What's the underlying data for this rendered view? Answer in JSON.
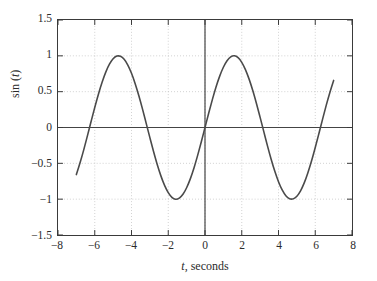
{
  "chart_data": {
    "type": "line",
    "title": "",
    "xlabel": "t, seconds",
    "xlabel_parts": {
      "symbol": "t",
      "rest": ", seconds"
    },
    "ylabel": "sin (t)",
    "ylabel_parts": {
      "prefix": "sin (",
      "symbol": "t",
      "suffix": ")"
    },
    "xlim": [
      -8,
      8
    ],
    "ylim": [
      -1.5,
      1.5
    ],
    "xticks": [
      -8,
      -6,
      -4,
      -2,
      0,
      2,
      4,
      6,
      8
    ],
    "xtick_labels": [
      "−8",
      "−6",
      "−4",
      "−2",
      "0",
      "2",
      "4",
      "6",
      "8"
    ],
    "yticks": [
      -1.5,
      -1,
      -0.5,
      0,
      0.5,
      1,
      1.5
    ],
    "ytick_labels": [
      "−1.5",
      "−1",
      "−0.5",
      "0",
      "0.5",
      "1",
      "1.5"
    ],
    "grid": true,
    "grid_style": "dotted",
    "legend": "none",
    "series": [
      {
        "name": "sin (t)",
        "color": "#4a4a4a",
        "line_width": 1.6,
        "x_start": -7,
        "x_end": 7,
        "x": [
          -7.0,
          -6.8,
          -6.6,
          -6.4,
          -6.2,
          -6.0,
          -5.8,
          -5.6,
          -5.4,
          -5.2,
          -5.0,
          -4.8,
          -4.6,
          -4.4,
          -4.2,
          -4.0,
          -3.8,
          -3.6,
          -3.4,
          -3.2,
          -3.0,
          -2.8,
          -2.6,
          -2.4,
          -2.2,
          -2.0,
          -1.8,
          -1.6,
          -1.4,
          -1.2,
          -1.0,
          -0.8,
          -0.6,
          -0.4,
          -0.2,
          0.0,
          0.2,
          0.4,
          0.6,
          0.8,
          1.0,
          1.2,
          1.4,
          1.6,
          1.8,
          2.0,
          2.2,
          2.4,
          2.6,
          2.8,
          3.0,
          3.2,
          3.4,
          3.6,
          3.8,
          4.0,
          4.2,
          4.4,
          4.6,
          4.8,
          5.0,
          5.2,
          5.4,
          5.6,
          5.8,
          6.0,
          6.2,
          6.4,
          6.6,
          6.8,
          7.0
        ],
        "y": [
          -0.657,
          -0.493,
          -0.312,
          -0.117,
          0.083,
          0.279,
          0.465,
          0.631,
          0.773,
          0.883,
          0.959,
          0.996,
          0.994,
          0.952,
          0.872,
          0.757,
          0.612,
          0.443,
          0.256,
          0.058,
          -0.141,
          -0.335,
          -0.516,
          -0.675,
          -0.808,
          -0.909,
          -0.974,
          -1.0,
          -0.985,
          -0.932,
          -0.841,
          -0.717,
          -0.565,
          -0.389,
          -0.199,
          0.0,
          0.199,
          0.389,
          0.565,
          0.717,
          0.841,
          0.932,
          0.985,
          1.0,
          0.974,
          0.909,
          0.808,
          0.675,
          0.516,
          0.335,
          0.141,
          -0.058,
          -0.256,
          -0.443,
          -0.612,
          -0.757,
          -0.872,
          -0.952,
          -0.994,
          -0.996,
          -0.959,
          -0.883,
          -0.773,
          -0.631,
          -0.465,
          -0.279,
          -0.083,
          0.117,
          0.312,
          0.493,
          0.657
        ],
        "peaks": [
          {
            "x": -4.71,
            "y": 1.0
          },
          {
            "x": 1.57,
            "y": 1.0
          }
        ],
        "troughs": [
          {
            "x": -1.57,
            "y": -1.0
          },
          {
            "x": 4.71,
            "y": -1.0
          }
        ],
        "zero_crossings": [
          -6.28,
          -3.14,
          0.0,
          3.14,
          6.28
        ]
      }
    ],
    "colors": {
      "curve": "#4a4a4a",
      "frame": "#3a3a3a",
      "axis_line": "#444444",
      "grid": "#b8b8b8",
      "text": "#2b2b2b",
      "background": "#ffffff"
    }
  }
}
